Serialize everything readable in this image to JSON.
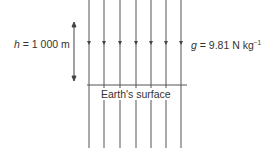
{
  "diagram": {
    "height_label": {
      "symbol": "h",
      "equals": " = ",
      "value": "1 000 m"
    },
    "gravity_label": {
      "symbol": "g",
      "equals": " = ",
      "value": "9.81 N kg",
      "exponent": "−1"
    },
    "surface_label": "Earth's surface",
    "field_lines": {
      "count": 7,
      "x_positions": [
        89,
        104,
        120,
        136,
        151,
        166,
        181
      ],
      "direction": "down"
    },
    "colors": {
      "line": "#555555",
      "text": "#333333",
      "background": "#ffffff"
    }
  }
}
